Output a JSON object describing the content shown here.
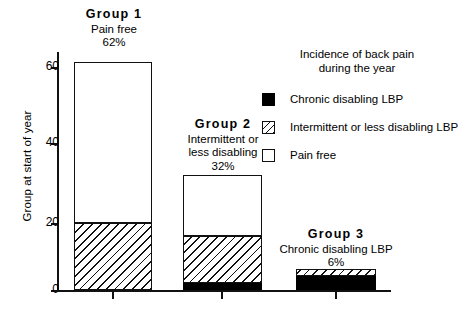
{
  "chart_data": {
    "type": "bar",
    "subtype": "stacked-bar",
    "title": "",
    "xlabel": "",
    "ylabel": "Group at start of year",
    "ylim": [
      0,
      65
    ],
    "yticks": [
      0,
      20,
      40,
      60
    ],
    "ytick_labels": [
      "0",
      "20",
      "40",
      "60"
    ],
    "grid": false,
    "legend_position": "upper-right",
    "categories": [
      "Group 1",
      "Group 2",
      "Group 3"
    ],
    "category_totals": [
      62,
      32,
      6
    ],
    "series": [
      {
        "name": "Chronic disabling LBP",
        "fill": "solid-black",
        "values": [
          0,
          2,
          4.5
        ]
      },
      {
        "name": "Intermittent or less disabling LBP",
        "fill": "diagonal-hatch",
        "values": [
          19,
          15,
          1.5
        ]
      },
      {
        "name": "Pain free",
        "fill": "white",
        "values": [
          43,
          15,
          0
        ]
      }
    ],
    "annotations": [
      "Group 1 Pain free 62%",
      "Group 2 Intermittent or less disabling 32%",
      "Group 3 Chronic disabling LBP 6%"
    ]
  },
  "axes": {
    "y_title": "Group at start of year",
    "y_ticks": [
      {
        "label": "60",
        "top": 67
      },
      {
        "label": "40",
        "top": 143
      },
      {
        "label": "20",
        "top": 223
      },
      {
        "label": "0",
        "top": 290
      }
    ]
  },
  "groups": [
    {
      "key": "group-1",
      "title": "Group 1",
      "lines": [
        "Pain free"
      ],
      "percent": "62%",
      "caption_left": 58,
      "caption_top": 8,
      "caption_width": 112,
      "bar_left": 74,
      "bar_width": 78,
      "tick_left": 112,
      "segments": [
        {
          "style": "white",
          "top": 62,
          "height": 161
        },
        {
          "style": "hatch",
          "top": 223,
          "height": 67
        }
      ]
    },
    {
      "key": "group-2",
      "title": "Group 2",
      "lines": [
        "Intermittent  or",
        "less disabling"
      ],
      "percent": "32%",
      "caption_left": 166,
      "caption_top": 118,
      "caption_width": 114,
      "bar_left": 183,
      "bar_width": 79,
      "tick_left": 221,
      "segments": [
        {
          "style": "white",
          "top": 175,
          "height": 61
        },
        {
          "style": "hatch",
          "top": 236,
          "height": 47
        },
        {
          "style": "black",
          "top": 283,
          "height": 7
        }
      ]
    },
    {
      "key": "group-3",
      "title": "Group 3",
      "lines": [
        "Chronic disabling LBP"
      ],
      "percent": "6%",
      "caption_left": 272,
      "caption_top": 228,
      "caption_width": 128,
      "bar_left": 296,
      "bar_width": 80,
      "tick_left": 335,
      "segments": [
        {
          "style": "hatch",
          "top": 269,
          "height": 7
        },
        {
          "style": "black",
          "top": 276,
          "height": 14
        }
      ]
    }
  ],
  "legend": {
    "title_line_1": "Incidence of back pain",
    "title_line_2": "during the year",
    "items": [
      {
        "key": "chronic-disabling-lbp",
        "swatch": "black",
        "label": "Chronic disabling LBP",
        "top": 44
      },
      {
        "key": "intermittent-lbp",
        "swatch": "hatch",
        "label": "Intermittent or less disabling LBP",
        "top": 72
      },
      {
        "key": "pain-free",
        "swatch": "white",
        "label": "Pain free",
        "top": 100
      }
    ]
  }
}
